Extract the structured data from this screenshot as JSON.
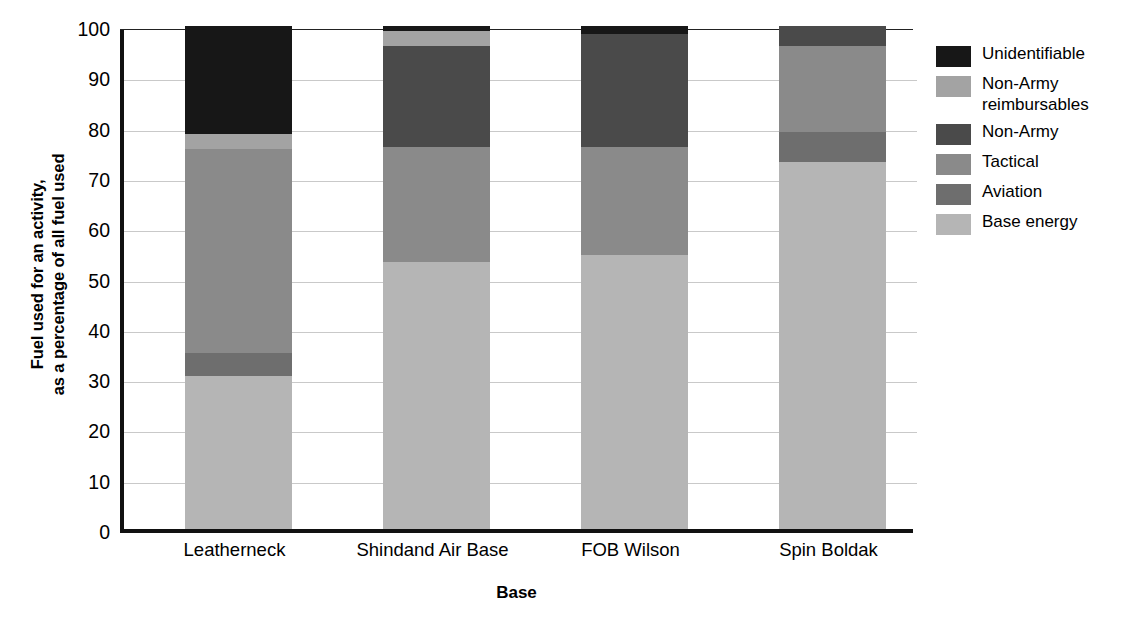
{
  "chart_data": {
    "type": "bar",
    "title": "",
    "subtitle": "",
    "stacked": true,
    "xlabel": "Base",
    "ylabel": "Fuel used for an activity,\nas a percentage of all fuel used",
    "ylabel_line1": "Fuel used for an activity,",
    "ylabel_line2": "as a percentage of all fuel used",
    "ylim": [
      0,
      100
    ],
    "yticks": [
      0,
      10,
      20,
      30,
      40,
      50,
      60,
      70,
      80,
      90,
      100
    ],
    "grid": true,
    "legend_position": "right",
    "categories": [
      "Leatherneck",
      "Shindand Air Base",
      "FOB Wilson",
      "Spin Boldak"
    ],
    "series": [
      {
        "name": "Base energy",
        "color": "#b5b5b5",
        "values": [
          30.5,
          53.0,
          54.5,
          73.0
        ]
      },
      {
        "name": "Aviation",
        "color": "#6e6e6e",
        "values": [
          4.5,
          0.0,
          0.0,
          6.0
        ]
      },
      {
        "name": "Tactical",
        "color": "#8a8a8a",
        "values": [
          40.5,
          23.0,
          21.5,
          17.0
        ]
      },
      {
        "name": "Non-Army",
        "color": "#4a4a4a",
        "values": [
          0.0,
          20.0,
          22.5,
          4.0
        ]
      },
      {
        "name": "Non-Army reimbursables",
        "color": "#a3a3a3",
        "values": [
          3.0,
          3.0,
          0.0,
          0.0
        ]
      },
      {
        "name": "Unidentifiable",
        "color": "#171717",
        "values": [
          21.5,
          1.0,
          1.5,
          0.0
        ]
      }
    ]
  },
  "legend": {
    "items": [
      {
        "label": "Unidentifiable",
        "color": "#171717"
      },
      {
        "label": "Non-Army\nreimbursables",
        "color": "#a3a3a3"
      },
      {
        "label": "Non-Army",
        "color": "#4a4a4a"
      },
      {
        "label": "Tactical",
        "color": "#8a8a8a"
      },
      {
        "label": "Aviation",
        "color": "#6e6e6e"
      },
      {
        "label": "Base energy",
        "color": "#b5b5b5"
      }
    ]
  },
  "axes": {
    "y_title_line1": "Fuel used for an activity,",
    "y_title_line2": "as a percentage of all fuel used",
    "x_title": "Base",
    "y_ticks": [
      "100",
      "90",
      "80",
      "70",
      "60",
      "50",
      "40",
      "30",
      "20",
      "10",
      "0"
    ],
    "x_ticks": [
      "Leatherneck",
      "Shindand Air Base",
      "FOB Wilson",
      "Spin Boldak"
    ]
  },
  "colors": {
    "axis": "#111111",
    "grid": "#c9c9c9",
    "background": "#ffffff"
  }
}
